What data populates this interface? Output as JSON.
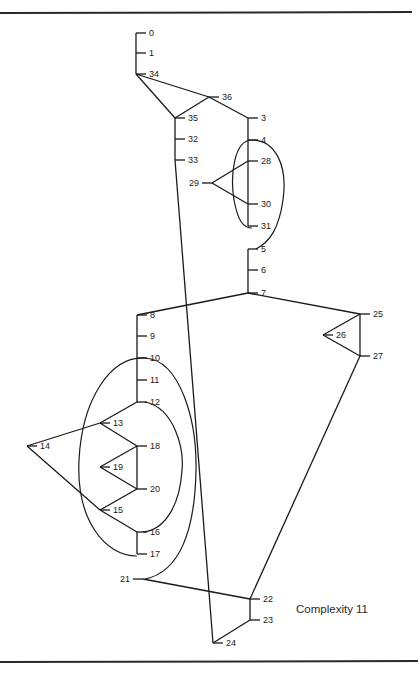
{
  "figure": {
    "caption": "Complexity 11",
    "nodes": [
      {
        "id": "0",
        "label": "0",
        "x": 136,
        "y": 33,
        "side": "right"
      },
      {
        "id": "1",
        "label": "1",
        "x": 136,
        "y": 53,
        "side": "right"
      },
      {
        "id": "34",
        "label": "34",
        "x": 136,
        "y": 74,
        "side": "right"
      },
      {
        "id": "36",
        "label": "36",
        "x": 209,
        "y": 97,
        "side": "right"
      },
      {
        "id": "35",
        "label": "35",
        "x": 175,
        "y": 118,
        "side": "right"
      },
      {
        "id": "3",
        "label": "3",
        "x": 248,
        "y": 118,
        "side": "right"
      },
      {
        "id": "32",
        "label": "32",
        "x": 175,
        "y": 139,
        "side": "right"
      },
      {
        "id": "33",
        "label": "33",
        "x": 175,
        "y": 160,
        "side": "right"
      },
      {
        "id": "4",
        "label": "4",
        "x": 248,
        "y": 140,
        "side": "right"
      },
      {
        "id": "28",
        "label": "28",
        "x": 248,
        "y": 161,
        "side": "right"
      },
      {
        "id": "29",
        "label": "29",
        "x": 212,
        "y": 183,
        "side": "left"
      },
      {
        "id": "30",
        "label": "30",
        "x": 248,
        "y": 204,
        "side": "right"
      },
      {
        "id": "31",
        "label": "31",
        "x": 248,
        "y": 226,
        "side": "right"
      },
      {
        "id": "5",
        "label": "5",
        "x": 248,
        "y": 249,
        "side": "right"
      },
      {
        "id": "6",
        "label": "6",
        "x": 248,
        "y": 270,
        "side": "right"
      },
      {
        "id": "7",
        "label": "7",
        "x": 248,
        "y": 293,
        "side": "right"
      },
      {
        "id": "25",
        "label": "25",
        "x": 360,
        "y": 314,
        "side": "right"
      },
      {
        "id": "26",
        "label": "26",
        "x": 323,
        "y": 335,
        "side": "right"
      },
      {
        "id": "27",
        "label": "27",
        "x": 360,
        "y": 356,
        "side": "right"
      },
      {
        "id": "8",
        "label": "8",
        "x": 137,
        "y": 315,
        "side": "right"
      },
      {
        "id": "9",
        "label": "9",
        "x": 137,
        "y": 336,
        "side": "right"
      },
      {
        "id": "10",
        "label": "10",
        "x": 137,
        "y": 358,
        "side": "right"
      },
      {
        "id": "11",
        "label": "11",
        "x": 137,
        "y": 380,
        "side": "right"
      },
      {
        "id": "12",
        "label": "12",
        "x": 137,
        "y": 402,
        "side": "right"
      },
      {
        "id": "13",
        "label": "13",
        "x": 100,
        "y": 423,
        "side": "right"
      },
      {
        "id": "14",
        "label": "14",
        "x": 27,
        "y": 446,
        "side": "right"
      },
      {
        "id": "18",
        "label": "18",
        "x": 137,
        "y": 446,
        "side": "right"
      },
      {
        "id": "19",
        "label": "19",
        "x": 100,
        "y": 467,
        "side": "right"
      },
      {
        "id": "20",
        "label": "20",
        "x": 137,
        "y": 489,
        "side": "right"
      },
      {
        "id": "15",
        "label": "15",
        "x": 100,
        "y": 510,
        "side": "right"
      },
      {
        "id": "16",
        "label": "16",
        "x": 137,
        "y": 532,
        "side": "right"
      },
      {
        "id": "17",
        "label": "17",
        "x": 137,
        "y": 554,
        "side": "right"
      },
      {
        "id": "21",
        "label": "21",
        "x": 143,
        "y": 579,
        "side": "left"
      },
      {
        "id": "22",
        "label": "22",
        "x": 250,
        "y": 599,
        "side": "right"
      },
      {
        "id": "23",
        "label": "23",
        "x": 250,
        "y": 620,
        "side": "right"
      },
      {
        "id": "24",
        "label": "24",
        "x": 213,
        "y": 643,
        "side": "right"
      }
    ],
    "edges": [
      [
        "0",
        "1"
      ],
      [
        "1",
        "34"
      ],
      [
        "34",
        "35"
      ],
      [
        "34",
        "36"
      ],
      [
        "36",
        "35"
      ],
      [
        "36",
        "3"
      ],
      [
        "35",
        "32"
      ],
      [
        "32",
        "33"
      ],
      [
        "33",
        "24"
      ],
      [
        "3",
        "4"
      ],
      [
        "4",
        "28"
      ],
      [
        "28",
        "30"
      ],
      [
        "30",
        "31"
      ],
      [
        "29",
        "28"
      ],
      [
        "29",
        "30"
      ],
      [
        "5",
        "6"
      ],
      [
        "6",
        "7"
      ],
      [
        "7",
        "8"
      ],
      [
        "7",
        "25"
      ],
      [
        "25",
        "27"
      ],
      [
        "25",
        "26"
      ],
      [
        "26",
        "27"
      ],
      [
        "27",
        "22"
      ],
      [
        "8",
        "9"
      ],
      [
        "9",
        "10"
      ],
      [
        "10",
        "11"
      ],
      [
        "11",
        "12"
      ],
      [
        "12",
        "13"
      ],
      [
        "13",
        "18"
      ],
      [
        "13",
        "14"
      ],
      [
        "14",
        "15"
      ],
      [
        "18",
        "20"
      ],
      [
        "18",
        "19"
      ],
      [
        "19",
        "20"
      ],
      [
        "20",
        "15"
      ],
      [
        "15",
        "16"
      ],
      [
        "16",
        "17"
      ],
      [
        "21",
        "22"
      ],
      [
        "22",
        "23"
      ],
      [
        "23",
        "24"
      ]
    ],
    "loops": [
      {
        "from": "4",
        "to": "5",
        "description": "ellipse around 4..31 closing to 5"
      },
      {
        "from": "10",
        "to": "21",
        "description": "outer loop around 10..17 closing to 21"
      },
      {
        "from": "12",
        "to": "16",
        "description": "inner loop around 12..16"
      }
    ]
  }
}
